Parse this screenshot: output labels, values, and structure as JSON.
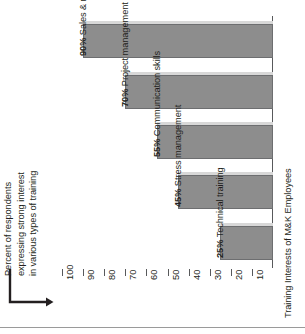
{
  "chart_data": {
    "type": "bar",
    "orientation": "horizontal",
    "title": "",
    "xlabel": "Percent of respondents expressing strong interest in various types of training",
    "ylabel": "Training Interests of M&K Employees",
    "categories": [
      "Sales & marketing training",
      "Project management",
      "Communication skills",
      "Stress management",
      "Technical training"
    ],
    "values": [
      90,
      70,
      55,
      45,
      25
    ],
    "value_labels": [
      "90%",
      "70%",
      "55%",
      "45%",
      "25%"
    ],
    "bar_labels": [
      "Sales & marketing training",
      "Project management",
      "Communication skills",
      "Stress management",
      "Technical training"
    ],
    "xlim": [
      0,
      100
    ],
    "xticks": [
      100,
      90,
      80,
      70,
      60,
      50,
      40,
      30,
      20,
      10
    ],
    "xtick_labels": [
      "100",
      "90",
      "80",
      "70",
      "60",
      "50",
      "40",
      "30",
      "20",
      "10"
    ],
    "axis_direction": "descending-left-to-right",
    "grid": false,
    "legend": null,
    "bar_color": "#8d8d8d",
    "bar_edge_color": "#6d6e70",
    "bar_shadow_color": "#d8d8d8",
    "axis_color": "#58595b",
    "text_color": "#231f20"
  },
  "axis_title_left": {
    "lines": [
      "Percent of respondents",
      "expressing strong interest",
      "in various types of training"
    ]
  },
  "axis_title_right": {
    "text": "Training Interests of M&K Employees"
  },
  "bars": [
    {
      "value_label": "90%",
      "category": " Sales & marketing training",
      "value": 90
    },
    {
      "value_label": "70%",
      "category": " Project management",
      "value": 70
    },
    {
      "value_label": "55%",
      "category": " Communication skills",
      "value": 55
    },
    {
      "value_label": "45%",
      "category": " Stress management",
      "value": 45
    },
    {
      "value_label": "25%",
      "category": " Technical training",
      "value": 25
    }
  ],
  "ticks": [
    {
      "label": "100"
    },
    {
      "label": "90"
    },
    {
      "label": "80"
    },
    {
      "label": "70"
    },
    {
      "label": "60"
    },
    {
      "label": "50"
    },
    {
      "label": "40"
    },
    {
      "label": "30"
    },
    {
      "label": "20"
    },
    {
      "label": "10"
    }
  ]
}
